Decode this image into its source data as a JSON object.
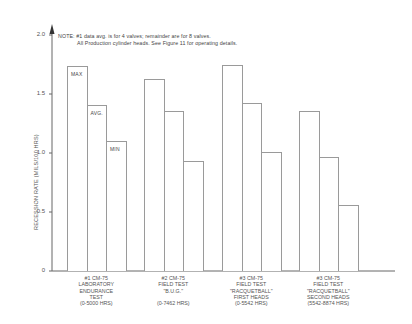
{
  "chart_data": {
    "type": "bar",
    "title": "",
    "note": [
      "NOTE:  #1 data avg. is for 4 valves; remainder are for 8 valves.",
      "All Production cylinder heads.  See Figure 11 for operating details."
    ],
    "xlabel": "",
    "ylabel": "RECESSION RATE (MILS/100 HRS)",
    "ylim": [
      0,
      2.0
    ],
    "yticks": [
      "0",
      "0.5",
      "1.0",
      "1.5",
      "2.0"
    ],
    "grid": false,
    "legend": "inline labels on first group (MAX, AVG., MIN)",
    "categories": [
      "#1 CM-75\nLABORATORY\nENDURANCE\nTEST\n(0-5000 HRS)",
      "#2 CM-75\nFIELD TEST\n\"B.U.G.\"\n\n(0-7462 HRS)",
      "#3 CM-75\nFIELD TEST\n\"RACQUETBALL\"\nFIRST HEADS\n(0-5542 HRS)",
      "#3 CM-75\nFIELD TEST\n\"RACQUETBALL\"\nSECOND HEADS\n(5542-8874 HRS)"
    ],
    "series": [
      {
        "name": "MAX",
        "values": [
          1.74,
          1.63,
          1.75,
          1.36
        ]
      },
      {
        "name": "AVG.",
        "values": [
          1.41,
          1.36,
          1.42,
          0.97
        ]
      },
      {
        "name": "MIN",
        "values": [
          1.1,
          0.93,
          1.01,
          0.56
        ]
      }
    ]
  }
}
